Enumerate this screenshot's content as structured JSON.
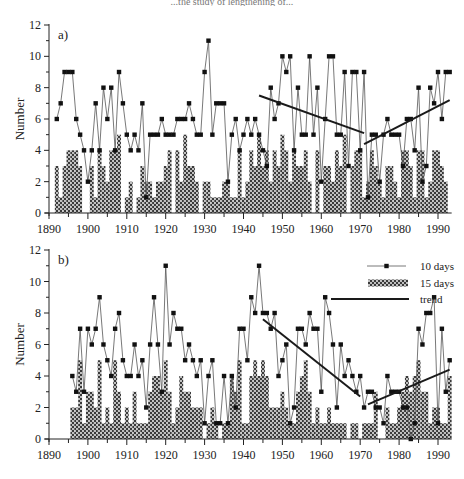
{
  "figure": {
    "caption_fragment": "...the study of lengthening of..."
  },
  "legend": {
    "items": [
      {
        "label": "10 days",
        "kind": "line-marker"
      },
      {
        "label": "15 days",
        "kind": "hatched-bar"
      },
      {
        "label": "trend",
        "kind": "line"
      }
    ]
  },
  "colors": {
    "line": "#555555",
    "marker": "#111111",
    "bar_fill": "#3a3a3a",
    "bar_dot": "#ffffff",
    "trend": "#1a1a1a",
    "axis": "#222222"
  },
  "chart_data": [
    {
      "panel": "a)",
      "type": "bar+line",
      "title": "",
      "xlabel": "",
      "ylabel": "Number",
      "xlim": [
        1890,
        1993
      ],
      "ylim": [
        0,
        12
      ],
      "xticks": [
        1890,
        1900,
        1910,
        1920,
        1930,
        1940,
        1950,
        1960,
        1970,
        1980,
        1990
      ],
      "yticks": [
        0,
        2,
        4,
        6,
        8,
        10,
        12
      ],
      "grid": false,
      "legend_position": "none",
      "x": [
        1892,
        1893,
        1894,
        1895,
        1896,
        1897,
        1898,
        1899,
        1900,
        1901,
        1902,
        1903,
        1904,
        1905,
        1906,
        1907,
        1908,
        1909,
        1910,
        1911,
        1912,
        1913,
        1914,
        1915,
        1916,
        1917,
        1918,
        1919,
        1920,
        1921,
        1922,
        1923,
        1924,
        1925,
        1926,
        1927,
        1928,
        1929,
        1930,
        1931,
        1932,
        1933,
        1934,
        1935,
        1936,
        1937,
        1938,
        1939,
        1940,
        1941,
        1942,
        1943,
        1944,
        1945,
        1946,
        1947,
        1948,
        1949,
        1950,
        1951,
        1952,
        1953,
        1954,
        1955,
        1956,
        1957,
        1958,
        1959,
        1960,
        1961,
        1962,
        1963,
        1964,
        1965,
        1966,
        1967,
        1968,
        1969,
        1970,
        1971,
        1972,
        1973,
        1974,
        1975,
        1976,
        1977,
        1978,
        1979,
        1980,
        1981,
        1982,
        1983,
        1984,
        1985,
        1986,
        1987,
        1988,
        1989,
        1990,
        1991,
        1992,
        1993
      ],
      "series": [
        {
          "name": "10 days",
          "type": "line",
          "values": [
            6,
            7,
            9,
            9,
            9,
            6,
            5,
            4,
            2,
            4,
            7,
            4,
            8,
            6,
            8,
            4,
            9,
            7,
            5,
            4,
            5,
            4,
            7,
            1,
            5,
            5,
            5,
            6,
            5,
            5,
            5,
            6,
            6,
            6,
            7,
            6,
            5,
            5,
            9,
            11,
            5,
            7,
            7,
            7,
            2,
            5,
            6,
            4,
            5,
            6,
            5,
            6,
            5,
            4,
            3,
            8,
            6,
            7,
            10,
            9,
            10,
            4,
            8,
            5,
            5,
            10,
            5,
            8,
            2,
            6,
            10,
            10,
            5,
            5,
            9,
            3,
            9,
            9,
            4,
            9,
            1,
            5,
            5,
            2,
            5,
            6,
            5,
            5,
            5,
            3,
            6,
            6,
            4,
            8,
            2,
            3,
            8,
            7,
            9,
            6,
            9,
            9,
            7,
            4,
            2,
            7
          ]
        },
        {
          "name": "15 days",
          "type": "bar",
          "values": [
            3,
            1,
            3,
            4,
            4,
            4,
            3,
            0,
            0,
            3,
            1,
            4,
            3,
            2,
            4,
            4,
            5,
            0,
            1,
            2,
            0,
            1,
            3,
            2,
            2,
            1,
            2,
            2,
            3,
            4,
            0,
            4,
            2,
            5,
            3,
            3,
            2,
            0,
            2,
            2,
            1,
            1,
            1,
            2,
            2,
            1,
            1,
            4,
            1,
            2,
            4,
            3,
            5,
            3,
            4,
            2,
            4,
            3,
            5,
            4,
            2,
            4,
            3,
            3,
            4,
            2,
            0,
            4,
            0,
            3,
            3,
            2,
            4,
            3,
            5,
            0,
            3,
            4,
            4,
            1,
            2,
            4,
            3,
            2,
            1,
            3,
            3,
            2,
            1,
            4,
            4,
            3,
            1,
            4,
            4,
            1,
            2,
            4,
            4,
            3,
            2,
            0,
            1,
            4
          ]
        },
        {
          "name": "trend",
          "type": "line",
          "segments": [
            {
              "x": [
                1944,
                1971
              ],
              "y": [
                7.5,
                5.1
              ]
            },
            {
              "x": [
                1971,
                1993
              ],
              "y": [
                4.4,
                7.2
              ]
            }
          ]
        }
      ]
    },
    {
      "panel": "b)",
      "type": "bar+line",
      "title": "",
      "xlabel": "",
      "ylabel": "Number",
      "xlim": [
        1890,
        1993
      ],
      "ylim": [
        0,
        12
      ],
      "xticks": [
        1890,
        1900,
        1910,
        1920,
        1930,
        1940,
        1950,
        1960,
        1970,
        1980,
        1990
      ],
      "yticks": [
        0,
        2,
        4,
        6,
        8,
        10,
        12
      ],
      "grid": false,
      "legend_position": "upper right",
      "x": [
        1896,
        1897,
        1898,
        1899,
        1900,
        1901,
        1902,
        1903,
        1904,
        1905,
        1906,
        1907,
        1908,
        1909,
        1910,
        1911,
        1912,
        1913,
        1914,
        1915,
        1916,
        1917,
        1918,
        1919,
        1920,
        1921,
        1922,
        1923,
        1924,
        1925,
        1926,
        1927,
        1928,
        1929,
        1930,
        1931,
        1932,
        1933,
        1934,
        1935,
        1936,
        1937,
        1938,
        1939,
        1940,
        1941,
        1942,
        1943,
        1944,
        1945,
        1946,
        1947,
        1948,
        1949,
        1950,
        1951,
        1952,
        1953,
        1954,
        1955,
        1956,
        1957,
        1958,
        1959,
        1960,
        1961,
        1962,
        1963,
        1964,
        1965,
        1966,
        1967,
        1968,
        1969,
        1970,
        1971,
        1972,
        1973,
        1974,
        1975,
        1976,
        1977,
        1978,
        1979,
        1980,
        1981,
        1982,
        1983,
        1984,
        1985,
        1986,
        1987,
        1988,
        1989,
        1990,
        1991,
        1992,
        1993
      ],
      "series": [
        {
          "name": "10 days",
          "type": "line",
          "values": [
            4,
            3,
            7,
            3,
            7,
            6,
            7,
            9,
            6,
            5,
            4,
            7,
            8,
            5,
            4,
            4,
            6,
            4,
            5,
            2,
            6,
            9,
            6,
            3,
            11,
            6,
            8,
            7,
            7,
            5,
            6,
            5,
            4,
            5,
            1,
            4,
            5,
            1,
            1,
            4,
            1,
            4,
            2,
            7,
            7,
            5,
            9,
            8,
            11,
            8,
            8,
            7,
            8,
            4,
            5,
            6,
            1,
            2,
            7,
            7,
            6,
            8,
            7,
            7,
            3,
            9,
            8,
            6,
            2,
            6,
            4,
            5,
            4,
            3,
            4,
            2,
            3,
            3,
            2,
            2,
            1,
            4,
            3,
            3,
            3,
            2,
            2,
            0,
            1,
            7,
            6,
            8,
            8,
            9,
            1,
            7,
            3,
            5
          ]
        },
        {
          "name": "15 days",
          "type": "bar",
          "values": [
            2,
            2,
            5,
            1,
            3,
            3,
            2,
            5,
            1,
            2,
            1,
            5,
            3,
            1,
            2,
            1,
            3,
            1,
            1,
            1,
            3,
            4,
            4,
            3,
            5,
            3,
            1,
            2,
            4,
            3,
            3,
            2,
            2,
            2,
            0,
            1,
            2,
            1,
            0,
            1,
            1,
            4,
            3,
            5,
            1,
            1,
            4,
            5,
            4,
            5,
            4,
            2,
            2,
            2,
            3,
            2,
            1,
            1,
            3,
            4,
            5,
            3,
            1,
            2,
            1,
            1,
            2,
            1,
            1,
            1,
            1,
            0,
            1,
            1,
            0,
            1,
            1,
            1,
            3,
            0,
            0,
            2,
            1,
            1,
            2,
            3,
            4,
            3,
            4,
            5,
            3,
            3,
            1,
            2,
            2,
            1,
            1,
            4
          ]
        },
        {
          "name": "trend",
          "type": "line",
          "segments": [
            {
              "x": [
                1945,
                1970
              ],
              "y": [
                7.6,
                2.7
              ]
            },
            {
              "x": [
                1972,
                1993
              ],
              "y": [
                2.2,
                4.4
              ]
            }
          ]
        }
      ]
    }
  ]
}
